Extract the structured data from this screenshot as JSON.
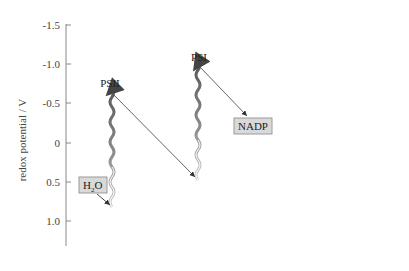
{
  "diagram": {
    "type": "Z-scheme",
    "y_axis": {
      "title": "redox potential / V",
      "ticks": [
        "-1.5",
        "-1.0",
        "-0.5",
        "0",
        "0.5",
        "1.0"
      ]
    },
    "nodes": {
      "psii": "PSII",
      "psi": "PSI",
      "h2o_main": "H",
      "h2o_sub": "2",
      "h2o_end": "O",
      "nadp": "NADP"
    },
    "colors": {
      "axis": "#888888",
      "box_fill": "#d9d9d9",
      "box_stroke": "#9a9a9a",
      "wave_dark": "#6e6e6e",
      "wave_light": "#c8c8c8",
      "arrow": "#444444"
    }
  }
}
